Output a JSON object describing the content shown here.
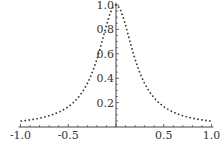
{
  "chart_data": {
    "type": "line",
    "title": "",
    "xlabel": "",
    "ylabel": "",
    "xlim": [
      -1.0,
      1.0
    ],
    "ylim": [
      0,
      1.0
    ],
    "grid": false,
    "legend": null,
    "x_ticks": [
      "-1.0",
      "-0.5",
      "0.5",
      "1.0"
    ],
    "y_ticks": [
      "0.2",
      "0.4",
      "0.6",
      "0.8",
      "1.0"
    ],
    "series": [
      {
        "name": "f(x)",
        "style": "dotted",
        "color": "#333333",
        "x": [
          -1.0,
          -0.9,
          -0.8,
          -0.7,
          -0.6,
          -0.5,
          -0.4,
          -0.3,
          -0.2,
          -0.1,
          0.0,
          0.1,
          0.2,
          0.3,
          0.4,
          0.5,
          0.6,
          0.7,
          0.8,
          0.9,
          1.0
        ],
        "y": [
          0.048,
          0.058,
          0.072,
          0.093,
          0.122,
          0.167,
          0.238,
          0.357,
          0.556,
          0.833,
          1.0,
          0.833,
          0.556,
          0.357,
          0.238,
          0.167,
          0.122,
          0.093,
          0.072,
          0.058,
          0.048
        ]
      }
    ]
  }
}
